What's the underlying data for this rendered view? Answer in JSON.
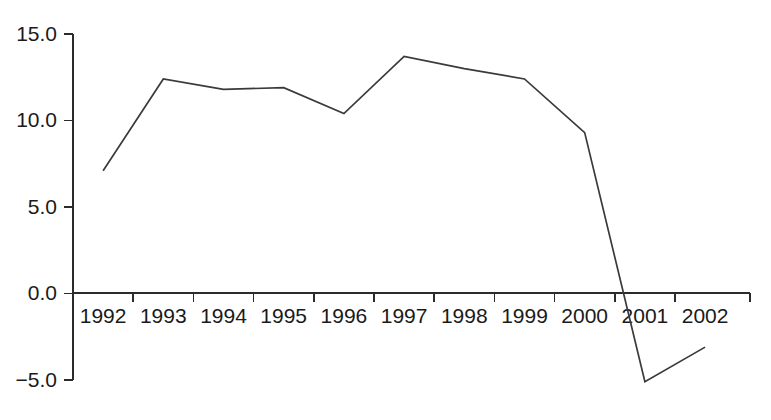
{
  "chart_data": {
    "type": "line",
    "title": "",
    "subtitle": "",
    "xlabel": "",
    "ylabel": "",
    "categories": [
      "1992",
      "1993",
      "1994",
      "1995",
      "1996",
      "1997",
      "1998",
      "1999",
      "2000",
      "2001",
      "2002"
    ],
    "x": [
      1992,
      1993,
      1994,
      1995,
      1996,
      1997,
      1998,
      1999,
      2000,
      2001,
      2002
    ],
    "values": [
      7.1,
      12.4,
      11.8,
      11.9,
      10.4,
      13.7,
      13.0,
      12.4,
      9.3,
      -5.1,
      -3.1
    ],
    "series": [
      {
        "name": "",
        "values": [
          7.1,
          12.4,
          11.8,
          11.9,
          10.4,
          13.7,
          13.0,
          12.4,
          9.3,
          -5.1,
          -3.1
        ]
      }
    ],
    "ylim": [
      -5.0,
      15.0
    ],
    "xlim": [
      1991.5,
      2002.5
    ],
    "yticks": [
      -5.0,
      0.0,
      5.0,
      10.0,
      15.0
    ],
    "ytick_labels": [
      "−5.0",
      "0.0",
      "5.0",
      "10.0",
      "15.0"
    ],
    "xtick_labels": [
      "1992",
      "1993",
      "1994",
      "1995",
      "1996",
      "1997",
      "1998",
      "1999",
      "2000",
      "2001",
      "2002"
    ],
    "grid": false,
    "legend": false,
    "legend_position": "none",
    "annotations": [],
    "line_color": "#3a3a3a",
    "axis_color": "#2b2b2b",
    "text_color": "#1a1a1a",
    "background_color": "#ffffff",
    "zero_line_value": 0.0
  }
}
